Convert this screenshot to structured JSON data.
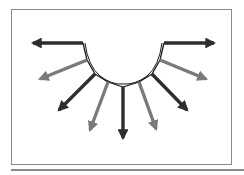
{
  "diagram": {
    "type": "radial-arrow-fan",
    "colors": {
      "dark": "#2e2e2e",
      "gray": "#7a7a7a",
      "frame": "#8a8a8a",
      "arc": "#1a1a1a"
    },
    "arrows": [
      {
        "id": "arrow-1",
        "shade": "dark",
        "from": [
          83,
          43
        ],
        "to": [
          33,
          43
        ]
      },
      {
        "id": "arrow-2",
        "shade": "gray",
        "from": [
          87,
          60
        ],
        "to": [
          40,
          79
        ]
      },
      {
        "id": "arrow-3",
        "shade": "dark",
        "from": [
          95,
          74
        ],
        "to": [
          59,
          110
        ]
      },
      {
        "id": "arrow-4",
        "shade": "gray",
        "from": [
          108,
          82
        ],
        "to": [
          90,
          130
        ]
      },
      {
        "id": "arrow-5",
        "shade": "dark",
        "from": [
          123,
          87
        ],
        "to": [
          123,
          138
        ]
      },
      {
        "id": "arrow-6",
        "shade": "gray",
        "from": [
          139,
          82
        ],
        "to": [
          156,
          129
        ]
      },
      {
        "id": "arrow-7",
        "shade": "dark",
        "from": [
          152,
          74
        ],
        "to": [
          187,
          110
        ]
      },
      {
        "id": "arrow-8",
        "shade": "gray",
        "from": [
          160,
          60
        ],
        "to": [
          206,
          79
        ]
      },
      {
        "id": "arrow-9",
        "shade": "dark",
        "from": [
          164,
          43
        ],
        "to": [
          214,
          43
        ]
      }
    ]
  }
}
